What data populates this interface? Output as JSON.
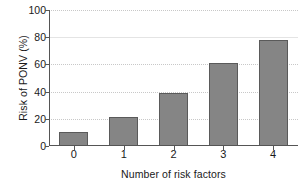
{
  "chart_data": {
    "type": "bar",
    "title": "",
    "xlabel": "Number of risk factors",
    "ylabel": "Risk of PONV (%)",
    "categories": [
      "0",
      "1",
      "2",
      "3",
      "4"
    ],
    "values": [
      10,
      21,
      39,
      61,
      78
    ],
    "series": [
      {
        "name": "Risk of PONV",
        "values": [
          10,
          21,
          39,
          61,
          78
        ]
      }
    ],
    "ylim": [
      0,
      100
    ],
    "yticks": [
      0,
      20,
      40,
      60,
      80,
      100
    ],
    "ytick_labels": [
      "0",
      "20",
      "40",
      "60",
      "80",
      "100"
    ],
    "xtick_labels": [
      "0",
      "1",
      "2",
      "3",
      "4"
    ],
    "grid": true,
    "grid_axis": "y",
    "legend": false,
    "legend_position": "none",
    "bar_color": "#858585",
    "bar_edge_color": "#5a5a5a",
    "grid_color": "#c8c8c8",
    "axis_color": "#555555",
    "background_color": "#ffffff"
  }
}
